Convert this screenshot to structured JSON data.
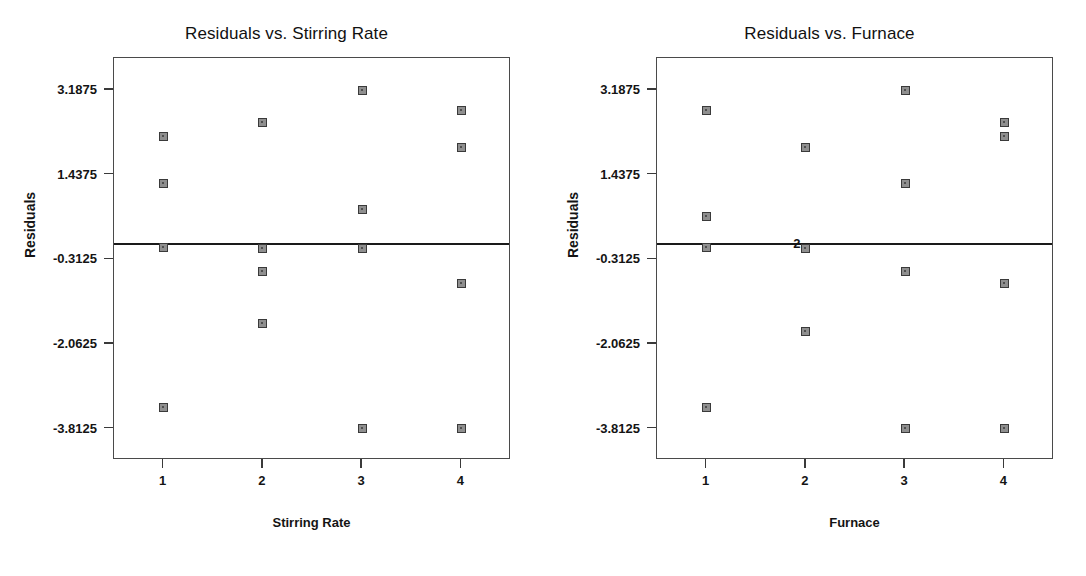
{
  "page": {
    "width": 1086,
    "height": 576,
    "background": "#ffffff",
    "marker_fill": "#8f8f8f",
    "marker_edge": "#3a3a3a",
    "frame_color": "#4a4a4a",
    "ref_line_color": "#1a1a1a"
  },
  "chart_data": [
    {
      "type": "scatter",
      "title": "Residuals vs. Stirring Rate",
      "xlabel": "Stirring Rate",
      "ylabel": "Residuals",
      "xticks": [
        "1",
        "2",
        "3",
        "4"
      ],
      "xtick_values": [
        1,
        2,
        3,
        4
      ],
      "yticks": [
        "3.1875",
        "1.4375",
        "-0.3125",
        "-2.0625",
        "-3.8125"
      ],
      "ytick_values": [
        3.1875,
        1.4375,
        -0.3125,
        -2.0625,
        -3.8125
      ],
      "xlim": [
        0.5,
        4.5
      ],
      "ylim": [
        -4.46,
        3.85
      ],
      "grid": false,
      "legend": null,
      "reference_line": {
        "y": 0.0,
        "label": null
      },
      "points": [
        {
          "x": 1,
          "y": 2.23
        },
        {
          "x": 1,
          "y": 1.25
        },
        {
          "x": 1,
          "y": -0.06
        },
        {
          "x": 1,
          "y": -3.38
        },
        {
          "x": 2,
          "y": 2.52
        },
        {
          "x": 2,
          "y": -0.08
        },
        {
          "x": 2,
          "y": -0.56
        },
        {
          "x": 2,
          "y": -1.63
        },
        {
          "x": 3,
          "y": 3.1875
        },
        {
          "x": 3,
          "y": 0.72
        },
        {
          "x": 3,
          "y": -0.08
        },
        {
          "x": 3,
          "y": -3.8125
        },
        {
          "x": 4,
          "y": 2.76
        },
        {
          "x": 4,
          "y": 1.99
        },
        {
          "x": 4,
          "y": -0.82
        },
        {
          "x": 4,
          "y": -3.8125
        }
      ]
    },
    {
      "type": "scatter",
      "title": "Residuals vs. Furnace",
      "xlabel": "Furnace",
      "ylabel": "Residuals",
      "xticks": [
        "1",
        "2",
        "3",
        "4"
      ],
      "xtick_values": [
        1,
        2,
        3,
        4
      ],
      "yticks": [
        "3.1875",
        "1.4375",
        "-0.3125",
        "-2.0625",
        "-3.8125"
      ],
      "ytick_values": [
        3.1875,
        1.4375,
        -0.3125,
        -2.0625,
        -3.8125
      ],
      "xlim": [
        0.5,
        4.5
      ],
      "ylim": [
        -4.46,
        3.85
      ],
      "grid": false,
      "legend": null,
      "reference_line": {
        "y": 0.0,
        "label": "2",
        "label_x": 2.0
      },
      "points": [
        {
          "x": 1,
          "y": 2.76
        },
        {
          "x": 1,
          "y": 0.58
        },
        {
          "x": 1,
          "y": -0.06
        },
        {
          "x": 1,
          "y": -3.38
        },
        {
          "x": 2,
          "y": 1.99
        },
        {
          "x": 2,
          "y": -0.08
        },
        {
          "x": 2,
          "y": -1.8
        },
        {
          "x": 3,
          "y": 3.1875
        },
        {
          "x": 3,
          "y": 1.25
        },
        {
          "x": 3,
          "y": -0.56
        },
        {
          "x": 3,
          "y": -3.8125
        },
        {
          "x": 4,
          "y": 2.52
        },
        {
          "x": 4,
          "y": 2.23
        },
        {
          "x": 4,
          "y": -0.82
        },
        {
          "x": 4,
          "y": -3.8125
        }
      ]
    }
  ]
}
